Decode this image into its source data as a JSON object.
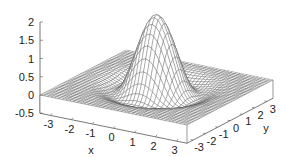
{
  "chart_data": {
    "type": "surface",
    "title": "",
    "function": "mexican-hat-like: z = 2*exp(-(x^2+y^2)/1.2) - 0.35*exp(-((sqrt(x^2+y^2)-1.6)^2)/0.5)",
    "xlabel": "x",
    "ylabel": "y",
    "zlabel": "",
    "x_range": [
      -3.5,
      3.5
    ],
    "y_range": [
      -3.5,
      3.5
    ],
    "z_range": [
      -0.5,
      2
    ],
    "x_ticks": [
      "-3",
      "-2",
      "-1",
      "0",
      "1",
      "2",
      "3"
    ],
    "y_ticks": [
      "-3",
      "-2",
      "-1",
      "0",
      "1",
      "2",
      "3"
    ],
    "z_ticks": [
      "-0.5",
      "0",
      "0.5",
      "1",
      "1.5",
      "2"
    ],
    "z_tick_values": [
      -0.5,
      0,
      0.5,
      1,
      1.5,
      2
    ],
    "peak": {
      "x": 0,
      "y": 0,
      "z": 2
    },
    "grid_lines": 40,
    "colors": {
      "mesh": "#555555",
      "axes": "#555555",
      "text": "#222222",
      "background": "#ffffff"
    }
  }
}
